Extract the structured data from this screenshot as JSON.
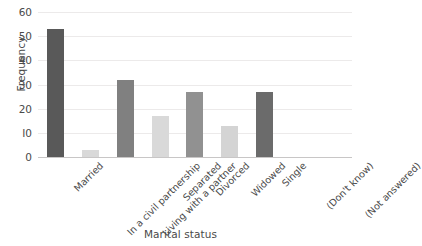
{
  "chart_data": {
    "type": "bar",
    "title": "",
    "xlabel": "Marital status",
    "ylabel": "Frequency",
    "categories": [
      "Married",
      "In a civil partnership",
      "Living with a partner",
      "Separated",
      "Divorced",
      "Widowed",
      "Single",
      "(Don't know)",
      "(Not answered)"
    ],
    "values": [
      53,
      3,
      32,
      17,
      27,
      13,
      27,
      0,
      0
    ],
    "bar_colors": [
      "#595959",
      "#d9d9d9",
      "#808080",
      "#d9d9d9",
      "#919191",
      "#d4d4d4",
      "#6b6b6b",
      "#ffffff",
      "#ffffff"
    ],
    "ylim": [
      0,
      60
    ],
    "yticks": [
      0,
      10,
      20,
      30,
      40,
      50,
      60
    ],
    "ytick_labels": [
      "0",
      "I0",
      "20",
      "30",
      "40",
      "50",
      "60"
    ],
    "grid": true,
    "legend": "none",
    "xtick_rotation": -45
  },
  "style": {
    "background": "#ffffff",
    "gridline_color": "#eceaea",
    "axis_color": "#c8c6c6",
    "text_color": "#4a4a4a"
  }
}
